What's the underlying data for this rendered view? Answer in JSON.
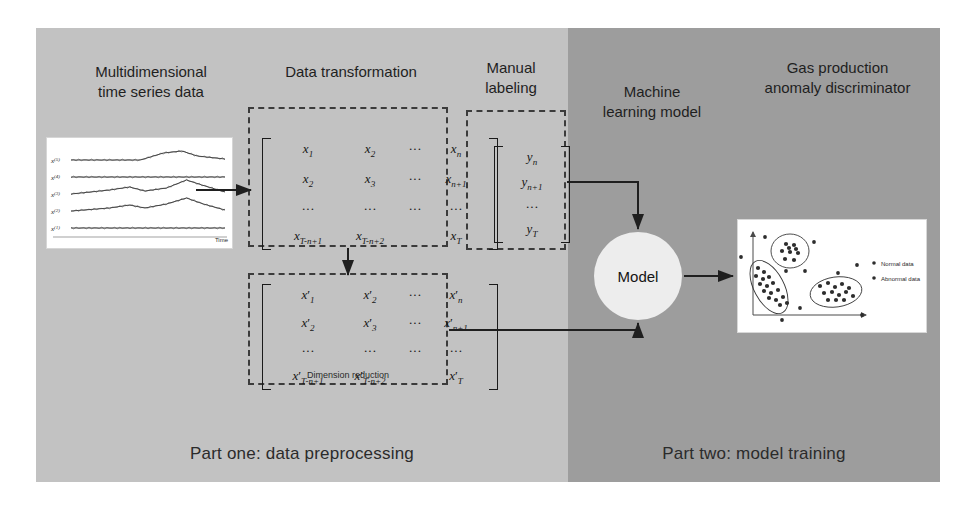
{
  "diagram": {
    "title_parts": {
      "left": "Part one: data preprocessing",
      "right": "Part two: model training"
    },
    "colors": {
      "panel_left": "#c2c2c2",
      "panel_right": "#9d9d9d",
      "node_fill": "#ededed",
      "line": "#222222",
      "dash": "#3b3b3b"
    },
    "headings": {
      "time_series": "Multidimensional\ntime series data",
      "data_transformation": "Data transformation",
      "manual_labeling": "Manual\nlabeling",
      "machine_learning_model": "Machine\nlearning model",
      "gas_production": "Gas production\nanomaly discriminator"
    },
    "time_series": {
      "series_labels": [
        "x(5)",
        "x(4)",
        "x(3)",
        "x(2)",
        "x(1)"
      ],
      "axis_label": "Time"
    },
    "matrix_raw": {
      "rows": [
        [
          "x1",
          "x2",
          "...",
          "xn"
        ],
        [
          "x2",
          "x3",
          "...",
          "xn+1"
        ],
        [
          "...",
          "...",
          "...",
          "..."
        ],
        [
          "xT-n+1",
          "xT-n+2",
          "",
          "xT"
        ]
      ]
    },
    "matrix_reduced": {
      "caption": "Dimension reduction",
      "rows": [
        [
          "x'1",
          "x'2",
          "...",
          "x'n"
        ],
        [
          "x'2",
          "x'3",
          "...",
          "x'n+1"
        ],
        [
          "...",
          "...",
          "...",
          "..."
        ],
        [
          "x'T-n+1",
          "x'T-n+2",
          "",
          "x'T"
        ]
      ]
    },
    "label_vector": {
      "rows": [
        "yn",
        "yn+1",
        "...",
        "yT"
      ]
    },
    "model_node": {
      "label": "Model"
    },
    "result_plot": {
      "legend": [
        "Normal data",
        "Abnormal data"
      ]
    }
  }
}
